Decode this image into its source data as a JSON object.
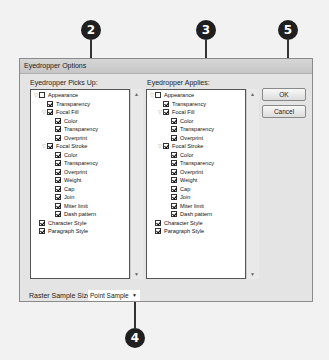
{
  "callouts": [
    {
      "n": "2",
      "x": 81,
      "y": 20
    },
    {
      "n": "3",
      "x": 196,
      "y": 20
    },
    {
      "n": "5",
      "x": 278,
      "y": 20
    },
    {
      "n": "4",
      "x": 125,
      "y": 328
    }
  ],
  "dialog": {
    "title": "Eyedropper Options"
  },
  "picks_up": {
    "label": "Eyedropper Picks Up:"
  },
  "applies": {
    "label": "Eyedropper Applies:"
  },
  "tree": [
    {
      "label": "Appearance",
      "level": 0,
      "expander": true,
      "checked": false
    },
    {
      "label": "Transparency",
      "level": 1,
      "expander": false,
      "checked": true
    },
    {
      "label": "Focal Fill",
      "level": 1,
      "expander": true,
      "checked": true
    },
    {
      "label": "Color",
      "level": 2,
      "expander": false,
      "checked": true
    },
    {
      "label": "Transparency",
      "level": 2,
      "expander": false,
      "checked": true
    },
    {
      "label": "Overprint",
      "level": 2,
      "expander": false,
      "checked": true
    },
    {
      "label": "Focal Stroke",
      "level": 1,
      "expander": true,
      "checked": true
    },
    {
      "label": "Color",
      "level": 2,
      "expander": false,
      "checked": true
    },
    {
      "label": "Transparency",
      "level": 2,
      "expander": false,
      "checked": true
    },
    {
      "label": "Overprint",
      "level": 2,
      "expander": false,
      "checked": true
    },
    {
      "label": "Weight",
      "level": 2,
      "expander": false,
      "checked": true
    },
    {
      "label": "Cap",
      "level": 2,
      "expander": false,
      "checked": true
    },
    {
      "label": "Join",
      "level": 2,
      "expander": false,
      "checked": true
    },
    {
      "label": "Miter limit",
      "level": 2,
      "expander": false,
      "checked": true
    },
    {
      "label": "Dash pattern",
      "level": 2,
      "expander": false,
      "checked": true
    },
    {
      "label": "Character Style",
      "level": 0,
      "expander": false,
      "checked": true
    },
    {
      "label": "Paragraph Style",
      "level": 0,
      "expander": false,
      "checked": true
    }
  ],
  "buttons": {
    "ok": "OK",
    "cancel": "Cancel"
  },
  "raster": {
    "label": "Raster Sample Size:",
    "value": "Point Sample"
  },
  "icons": {
    "expander": "▽",
    "scroll_up": "▲",
    "scroll_down": "▼",
    "dropdown": "▼"
  }
}
